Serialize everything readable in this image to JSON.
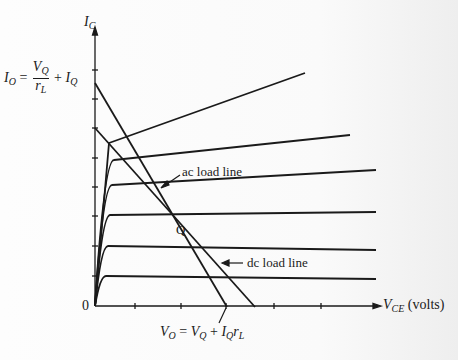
{
  "diagram": {
    "y_axis_label": "I_C",
    "x_axis_label": "V_CE",
    "x_axis_unit": "(volts)",
    "origin_label": "0",
    "q_point_label": "Q",
    "ac_load_line_label": "ac load line",
    "dc_load_line_label": "dc load line",
    "y_intercept_label": {
      "lhs": "I",
      "lhs_sub": "O",
      "eq": "=",
      "num": "V",
      "num_sub": "Q",
      "den": "r",
      "den_sub": "L",
      "plus": "+",
      "term": "I",
      "term_sub": "Q"
    },
    "x_intercept_label": {
      "lhs": "V",
      "lhs_sub": "O",
      "eq": "=",
      "t1": "V",
      "t1_sub": "Q",
      "plus": "+",
      "t2": "I",
      "t2_sub": "Q",
      "t3": "r",
      "t3_sub": "L"
    },
    "colors": {
      "line": "#1a1a1a",
      "background": "#fbfbfb"
    }
  }
}
